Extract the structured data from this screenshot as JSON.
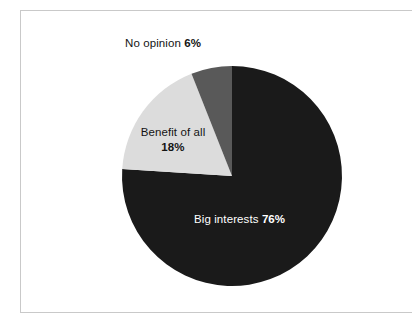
{
  "chart_data": {
    "type": "pie",
    "title": "",
    "subtitle": "",
    "xlabel": "",
    "ylabel": "",
    "legend_position": "none",
    "grid": false,
    "units": "percent",
    "start_angle_deg": 0,
    "direction": "clockwise",
    "categories": [
      "Big interests",
      "Benefit of all",
      "No opinion"
    ],
    "values": [
      76,
      18,
      6
    ],
    "colors": [
      "#1a1a1a",
      "#dcdcdc",
      "#595959"
    ],
    "slices": [
      {
        "label": "Big interests",
        "value": 76,
        "value_text": "76%",
        "color": "#1a1a1a",
        "label_color": "#ffffff",
        "start_deg": 0,
        "end_deg": 273.6
      },
      {
        "label": "Benefit of all",
        "value": 18,
        "value_text": "18%",
        "color": "#dcdcdc",
        "label_color": "#141414",
        "start_deg": 273.6,
        "end_deg": 338.4
      },
      {
        "label": "No opinion",
        "value": 6,
        "value_text": "6%",
        "color": "#595959",
        "label_color": "#141414",
        "start_deg": 338.4,
        "end_deg": 360
      }
    ]
  },
  "labels": {
    "no_opinion": {
      "name": "No opinion",
      "percent": "6%"
    },
    "benefit_of_all": {
      "name": "Benefit of all",
      "percent": "18%"
    },
    "big_interests": {
      "name": "Big interests",
      "percent": "76%"
    }
  },
  "geometry": {
    "center_x": 232,
    "center_y": 176,
    "radius": 110
  },
  "theme": {
    "background": "#ffffff",
    "frame_border": "#c9c9c9",
    "text": "#141414",
    "text_on_dark": "#ffffff"
  }
}
